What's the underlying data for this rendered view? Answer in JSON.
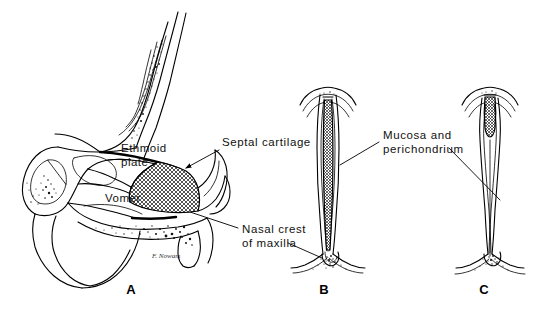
{
  "figure": {
    "background_color": "#ffffff",
    "ink_color": "#000000",
    "panels": [
      {
        "id": "A",
        "letter": "A",
        "caption": "Midsagittal view of the bony and cartilaginous nasal septum",
        "letter_x": 131,
        "letter_y": 294
      },
      {
        "id": "B",
        "letter": "B",
        "caption": "Coronal section of septum with intact septal cartilage",
        "letter_x": 324,
        "letter_y": 294
      },
      {
        "id": "C",
        "letter": "C",
        "caption": "Coronal section after submucous resection of cartilage",
        "letter_x": 484,
        "letter_y": 294
      }
    ],
    "labels": [
      {
        "id": "septal-cartilage",
        "lines": [
          "Septal cartilage"
        ],
        "text_x": 222,
        "text_y": 146,
        "anchor": "start",
        "leader_from": [
          219,
          150
        ],
        "leader_to": [
          186,
          168
        ],
        "arrowhead": true
      },
      {
        "id": "ethmoid-plate",
        "lines": [
          "Ethmoid",
          "plate"
        ],
        "text_x": 121,
        "text_y": 152,
        "anchor": "start",
        "leader_from": null,
        "leader_to": null,
        "arrowhead": false
      },
      {
        "id": "vomer",
        "lines": [
          "Vomer"
        ],
        "text_x": 105,
        "text_y": 202,
        "anchor": "start",
        "leader_from": null,
        "leader_to": null,
        "arrowhead": false
      },
      {
        "id": "nasal-crest-of-maxilla",
        "lines": [
          "Nasal crest",
          "of maxilla"
        ],
        "text_x": 242,
        "text_y": 233,
        "anchor": "start",
        "leader_from": [
          238,
          228
        ],
        "leader_to": [
          190,
          212
        ],
        "arrowhead": false
      },
      {
        "id": "mucosa-and-perichondrium",
        "lines": [
          "Mucosa  and",
          "perichondrium"
        ],
        "text_x": 383,
        "text_y": 139,
        "anchor": "start",
        "leader_from": [
          379,
          142
        ],
        "leader_to": [
          340,
          165
        ],
        "arrowhead": false
      }
    ],
    "signature": {
      "text": "F. Nowam",
      "x": 152,
      "y": 258
    },
    "secondary_leaders": [
      {
        "id": "mucosa-leader-to-c",
        "from": [
          449,
          148
        ],
        "to": [
          500,
          200
        ]
      },
      {
        "id": "nasal-crest-leader-to-b",
        "from": [
          288,
          243
        ],
        "to": [
          322,
          258
        ]
      }
    ]
  }
}
